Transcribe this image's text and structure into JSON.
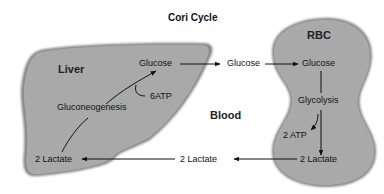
{
  "diagram": {
    "title": "Cori Cycle",
    "regions": {
      "liver": {
        "label": "Liver",
        "fill": "#a9a9a9"
      },
      "blood": {
        "label": "Blood"
      },
      "rbc": {
        "label": "RBC",
        "fill": "#a9a9a9"
      }
    },
    "nodes": {
      "liver_glucose": "Glucose",
      "liver_gluconeogenesis": "Gluconeogenesis",
      "liver_atp": "6ATP",
      "liver_lactate": "2 Lactate",
      "blood_glucose": "Glucose",
      "blood_lactate": "2 Lactate",
      "rbc_glucose": "Glucose",
      "rbc_glycolysis": "Glycolysis",
      "rbc_atp": "2 ATP",
      "rbc_lactate": "2 Lactate"
    },
    "edges": [
      {
        "from": "liver_glucose",
        "to": "blood_glucose"
      },
      {
        "from": "blood_glucose",
        "to": "rbc_glucose"
      },
      {
        "from": "rbc_glucose",
        "to": "rbc_lactate",
        "via": "rbc_glycolysis",
        "yields": "rbc_atp"
      },
      {
        "from": "rbc_lactate",
        "to": "blood_lactate"
      },
      {
        "from": "blood_lactate",
        "to": "liver_lactate"
      },
      {
        "from": "liver_lactate",
        "to": "liver_glucose",
        "via": "liver_gluconeogenesis",
        "consumes": "liver_atp"
      }
    ]
  }
}
